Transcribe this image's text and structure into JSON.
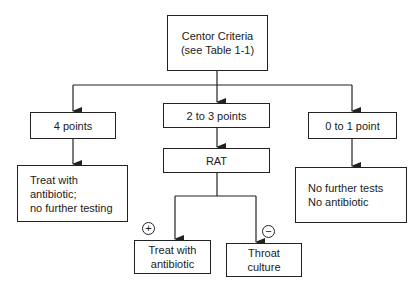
{
  "diagram": {
    "nodes": {
      "root": {
        "label": "Centor Criteria\n(see Table 1-1)"
      },
      "four_points": {
        "label": "4 points"
      },
      "two_three_points": {
        "label": "2 to 3 points"
      },
      "zero_one_point": {
        "label": "0 to 1 point"
      },
      "rat": {
        "label": "RAT"
      },
      "treat_no_testing": {
        "label": "Treat with\nantibiotic;\nno further testing"
      },
      "no_tests_no_antibiotic": {
        "label": "No further tests\nNo antibiotic"
      },
      "treat_antibiotic": {
        "label": "Treat with\nantibiotic"
      },
      "throat_culture": {
        "label": "Throat\nculture"
      }
    },
    "signs": {
      "positive": "+",
      "negative": "−"
    },
    "edges": [
      {
        "from": "root",
        "to": "four_points"
      },
      {
        "from": "root",
        "to": "two_three_points"
      },
      {
        "from": "root",
        "to": "zero_one_point"
      },
      {
        "from": "four_points",
        "to": "treat_no_testing"
      },
      {
        "from": "two_three_points",
        "to": "rat"
      },
      {
        "from": "zero_one_point",
        "to": "no_tests_no_antibiotic"
      },
      {
        "from": "rat",
        "to": "treat_antibiotic",
        "label": "+"
      },
      {
        "from": "rat",
        "to": "throat_culture",
        "label": "−"
      }
    ]
  }
}
